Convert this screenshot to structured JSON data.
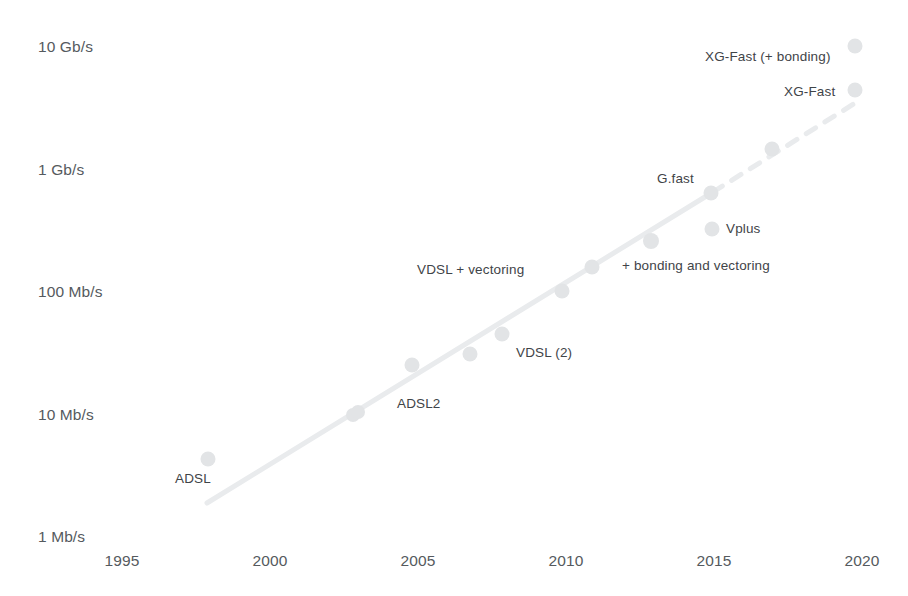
{
  "chart_data": {
    "type": "scatter",
    "title": "",
    "subtitle": "",
    "xlabel": "",
    "ylabel": "",
    "scale_y": "log",
    "grid": false,
    "legend": "none",
    "xlim": [
      1993.5,
      2021.5
    ],
    "ylim_mbps": [
      1,
      10000
    ],
    "x_ticks": [
      "1995",
      "2000",
      "2005",
      "2010",
      "2015",
      "2020"
    ],
    "x_tick_values": [
      1995,
      2000,
      2005,
      2010,
      2015,
      2020
    ],
    "y_ticks": [
      "10 Gb/s",
      "1 Gb/s",
      "100 Mb/s",
      "10 Mb/s",
      "1 Mb/s"
    ],
    "y_tick_values_mbps": [
      10000,
      1000,
      100,
      10,
      1
    ],
    "marker_color": "#e2e4e6",
    "line_color": "#e8eaec",
    "text_color": "#3f4448",
    "axis_text_color": "#555a5e",
    "points": [
      {
        "name": "ADSL",
        "year": 1998,
        "rate_mbps": 8,
        "label": "ADSL"
      },
      {
        "name": "ADSL2",
        "year": 2003,
        "rate_mbps": 12,
        "label": "ADSL2"
      },
      {
        "name": "ADSL2-b",
        "year": 2003,
        "rate_mbps": 13,
        "label": ""
      },
      {
        "name": "VDSL",
        "year": 2005,
        "rate_mbps": 27,
        "label": ""
      },
      {
        "name": "VDSL (2)",
        "year": 2007,
        "rate_mbps": 34,
        "label": "VDSL (2)"
      },
      {
        "name": "VDSL2",
        "year": 2008,
        "rate_mbps": 48,
        "label": ""
      },
      {
        "name": "VDSL + vectoring",
        "year": 2010,
        "rate_mbps": 100,
        "label": "VDSL + vectoring"
      },
      {
        "name": "bonding-vectoring",
        "year": 2011,
        "rate_mbps": 150,
        "label": "+ bonding  and vectoring"
      },
      {
        "name": "bonding-2013",
        "year": 2013,
        "rate_mbps": 250,
        "label": ""
      },
      {
        "name": "Vplus",
        "year": 2015,
        "rate_mbps": 300,
        "label": "Vplus"
      },
      {
        "name": "G.fast",
        "year": 2015,
        "rate_mbps": 800,
        "label": "G.fast"
      },
      {
        "name": "G.fast-2017",
        "year": 2017,
        "rate_mbps": 1800,
        "label": ""
      },
      {
        "name": "XG-Fast",
        "year": 2020,
        "rate_mbps": 5500,
        "label": "XG-Fast"
      },
      {
        "name": "XG-Fast (+ bonding)",
        "year": 2020,
        "rate_mbps": 9500,
        "label": "XG-Fast (+ bonding)"
      }
    ],
    "trend_line": {
      "solid": {
        "from": {
          "year": 1997.9,
          "rate_mbps": 3.6
        },
        "to": {
          "year": 2015,
          "rate_mbps": 800
        }
      },
      "dashed": {
        "from": {
          "year": 2015,
          "rate_mbps": 800
        },
        "to": {
          "year": 2020,
          "rate_mbps": 5500
        }
      }
    },
    "annotations": [
      {
        "text": "10 Gb/s",
        "kind": "y-tick"
      },
      {
        "text": "1 Gb/s",
        "kind": "y-tick"
      },
      {
        "text": "100 Mb/s",
        "kind": "y-tick"
      },
      {
        "text": "10 Mb/s",
        "kind": "y-tick"
      },
      {
        "text": "1 Mb/s",
        "kind": "y-tick"
      },
      {
        "text": "ADSL",
        "kind": "point-label"
      },
      {
        "text": "ADSL2",
        "kind": "point-label"
      },
      {
        "text": "VDSL (2)",
        "kind": "point-label"
      },
      {
        "text": "VDSL + vectoring",
        "kind": "point-label"
      },
      {
        "text": "+ bonding  and vectoring",
        "kind": "point-label"
      },
      {
        "text": "Vplus",
        "kind": "point-label"
      },
      {
        "text": "G.fast",
        "kind": "point-label"
      },
      {
        "text": "XG-Fast",
        "kind": "point-label"
      },
      {
        "text": "XG-Fast (+ bonding)",
        "kind": "point-label"
      }
    ]
  },
  "y_axis": {
    "ticks": [
      {
        "text": "10 Gb/s",
        "top": 38
      },
      {
        "text": "1 Gb/s",
        "top": 161
      },
      {
        "text": "100 Mb/s",
        "top": 283
      },
      {
        "text": "10 Mb/s",
        "top": 406
      },
      {
        "text": "1 Mb/s",
        "top": 528
      }
    ]
  },
  "x_axis": {
    "ticks": [
      {
        "text": "1995",
        "left": 122
      },
      {
        "text": "2000",
        "left": 270
      },
      {
        "text": "2005",
        "left": 418
      },
      {
        "text": "2010",
        "left": 566
      },
      {
        "text": "2015",
        "left": 714
      },
      {
        "text": "2020",
        "left": 862
      }
    ]
  },
  "point_labels": [
    {
      "text": "ADSL",
      "left": 175,
      "top": 471
    },
    {
      "text": "ADSL2",
      "left": 397,
      "top": 396
    },
    {
      "text": "VDSL (2)",
      "left": 516,
      "top": 345
    },
    {
      "text": "VDSL + vectoring",
      "left": 417,
      "top": 262
    },
    {
      "text": "+ bonding  and vectoring",
      "left": 622,
      "top": 258
    },
    {
      "text": "Vplus",
      "left": 726,
      "top": 221
    },
    {
      "text": "G.fast",
      "left": 657,
      "top": 171
    },
    {
      "text": "XG-Fast",
      "left": 784,
      "top": 84
    },
    {
      "text": "XG-Fast (+ bonding)",
      "left": 705,
      "top": 49
    }
  ],
  "markers": [
    {
      "name": "ADSL",
      "cx": 208,
      "cy": 459,
      "r": 7.5
    },
    {
      "name": "ADSL2",
      "cx": 353,
      "cy": 415,
      "r": 7.0
    },
    {
      "name": "ADSL2-b",
      "cx": 358,
      "cy": 412,
      "r": 7.0
    },
    {
      "name": "VDSL",
      "cx": 412,
      "cy": 365,
      "r": 7.5
    },
    {
      "name": "VDSL (2)",
      "cx": 470,
      "cy": 354,
      "r": 7.5
    },
    {
      "name": "VDSL2",
      "cx": 502,
      "cy": 334,
      "r": 7.5
    },
    {
      "name": "VDSL + vectoring",
      "cx": 562,
      "cy": 291,
      "r": 7.5
    },
    {
      "name": "bonding-vectoring",
      "cx": 592,
      "cy": 267,
      "r": 7.5
    },
    {
      "name": "bonding-2013",
      "cx": 651,
      "cy": 241,
      "r": 8.0
    },
    {
      "name": "Vplus",
      "cx": 712,
      "cy": 229,
      "r": 7.5
    },
    {
      "name": "G.fast",
      "cx": 711,
      "cy": 193,
      "r": 7.5
    },
    {
      "name": "G.fast-2017",
      "cx": 772,
      "cy": 149,
      "r": 7.5
    },
    {
      "name": "XG-Fast",
      "cx": 855,
      "cy": 90,
      "r": 7.5
    },
    {
      "name": "XG-Fast (+ bonding)",
      "cx": 855,
      "cy": 46,
      "r": 7.5
    }
  ],
  "trend": {
    "solid": {
      "x1": 207,
      "y1": 503,
      "x2": 713,
      "y2": 192
    },
    "dashed": {
      "x1": 713,
      "y1": 192,
      "x2": 860,
      "y2": 100
    }
  },
  "colors": {
    "marker": "#e2e4e6",
    "line": "#e9ebed",
    "label_text": "#3f4448",
    "axis_text": "#555a5e",
    "background": "#ffffff"
  }
}
